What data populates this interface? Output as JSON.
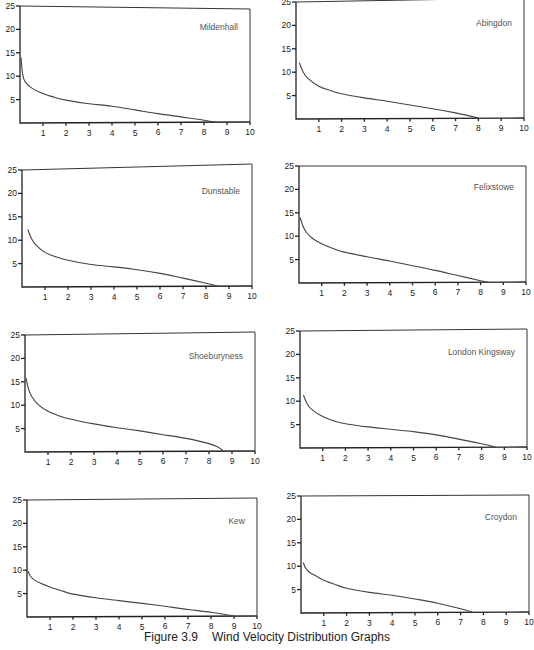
{
  "figure": {
    "number": "Figure 3.9",
    "title": "Wind Velocity Distribution Graphs"
  },
  "chart_data": [
    {
      "type": "line",
      "title": "Mildenhall",
      "xlabel": "",
      "ylabel": "",
      "xlim": [
        0,
        10
      ],
      "ylim": [
        0,
        25
      ],
      "x_ticks": [
        1,
        2,
        3,
        4,
        5,
        6,
        7,
        8,
        9,
        10
      ],
      "y_ticks": [
        5,
        10,
        15,
        20,
        25
      ],
      "grid": false,
      "x": [
        0.05,
        0.1,
        0.2,
        0.5,
        1,
        1.5,
        2,
        3,
        4,
        5,
        6,
        7,
        8,
        8.5
      ],
      "y": [
        14,
        11,
        9,
        7.5,
        6.3,
        5.5,
        4.9,
        4.1,
        3.6,
        2.8,
        2.0,
        1.3,
        0.6,
        0.2
      ]
    },
    {
      "type": "line",
      "title": "Abingdon",
      "xlabel": "",
      "ylabel": "",
      "xlim": [
        0,
        10
      ],
      "ylim": [
        0,
        25
      ],
      "x_ticks": [
        1,
        2,
        3,
        4,
        5,
        6,
        7,
        8,
        9,
        10
      ],
      "y_ticks": [
        5,
        10,
        15,
        20,
        25
      ],
      "grid": false,
      "x": [
        0.15,
        0.3,
        0.5,
        1,
        1.5,
        2,
        3,
        4,
        5,
        6,
        7,
        8
      ],
      "y": [
        12,
        10.2,
        8.8,
        7.0,
        6.1,
        5.4,
        4.5,
        3.8,
        3.0,
        2.2,
        1.3,
        0.2
      ]
    },
    {
      "type": "line",
      "title": "Dunstable",
      "xlabel": "",
      "ylabel": "",
      "xlim": [
        0,
        10
      ],
      "ylim": [
        0,
        25
      ],
      "x_ticks": [
        1,
        2,
        3,
        4,
        5,
        6,
        7,
        8,
        9,
        10
      ],
      "y_ticks": [
        5,
        10,
        15,
        20,
        25
      ],
      "grid": false,
      "x": [
        0.25,
        0.4,
        0.6,
        1,
        1.5,
        2,
        3,
        4,
        5,
        6,
        7,
        8,
        8.5
      ],
      "y": [
        12.3,
        10.5,
        9.0,
        7.4,
        6.4,
        5.7,
        4.8,
        4.3,
        3.7,
        2.9,
        1.9,
        0.8,
        0.2
      ]
    },
    {
      "type": "line",
      "title": "Felixstowe",
      "xlabel": "",
      "ylabel": "",
      "xlim": [
        0,
        10
      ],
      "ylim": [
        0,
        25
      ],
      "x_ticks": [
        1,
        2,
        3,
        4,
        5,
        6,
        7,
        8,
        9,
        10
      ],
      "y_ticks": [
        5,
        10,
        15,
        20,
        25
      ],
      "grid": false,
      "x": [
        0.05,
        0.15,
        0.3,
        0.6,
        1,
        1.5,
        2,
        3,
        4,
        5,
        6,
        7,
        8,
        8.3
      ],
      "y": [
        14,
        12.5,
        11,
        9.5,
        8.4,
        7.4,
        6.6,
        5.6,
        4.7,
        3.7,
        2.7,
        1.6,
        0.5,
        0.2
      ]
    },
    {
      "type": "line",
      "title": "Shoeburyness",
      "xlabel": "",
      "ylabel": "",
      "xlim": [
        0,
        10
      ],
      "ylim": [
        0,
        25
      ],
      "x_ticks": [
        1,
        2,
        3,
        4,
        5,
        6,
        7,
        8,
        9,
        10
      ],
      "y_ticks": [
        5,
        10,
        15,
        20,
        25
      ],
      "grid": false,
      "x": [
        0.05,
        0.15,
        0.3,
        0.6,
        1,
        1.5,
        2,
        3,
        4,
        5,
        6,
        7,
        8,
        8.4,
        8.6
      ],
      "y": [
        15.8,
        13.5,
        11.8,
        10.0,
        8.7,
        7.7,
        7.0,
        6.0,
        5.2,
        4.5,
        3.7,
        2.9,
        1.8,
        1.0,
        0.3
      ]
    },
    {
      "type": "line",
      "title": "London Kingsway",
      "xlabel": "",
      "ylabel": "",
      "xlim": [
        0,
        10
      ],
      "ylim": [
        0,
        25
      ],
      "x_ticks": [
        1,
        2,
        3,
        4,
        5,
        6,
        7,
        8,
        9,
        10
      ],
      "y_ticks": [
        5,
        10,
        15,
        20,
        25
      ],
      "grid": false,
      "x": [
        0.15,
        0.3,
        0.5,
        1,
        1.5,
        2,
        3,
        4,
        5,
        6,
        7,
        8,
        8.6
      ],
      "y": [
        11.3,
        9.6,
        8.3,
        6.7,
        5.8,
        5.2,
        4.5,
        4.0,
        3.5,
        2.8,
        1.9,
        0.9,
        0.2
      ]
    },
    {
      "type": "line",
      "title": "Kew",
      "xlabel": "",
      "ylabel": "",
      "xlim": [
        0,
        10
      ],
      "ylim": [
        0,
        25
      ],
      "x_ticks": [
        1,
        2,
        3,
        4,
        5,
        6,
        7,
        8,
        9,
        10
      ],
      "y_ticks": [
        5,
        10,
        15,
        20,
        25
      ],
      "grid": false,
      "x": [
        0.05,
        0.15,
        0.3,
        0.6,
        1,
        1.5,
        2,
        3,
        4,
        5,
        6,
        7,
        8,
        9
      ],
      "y": [
        9.8,
        8.7,
        8.0,
        7.2,
        6.4,
        5.6,
        4.9,
        4.1,
        3.5,
        2.9,
        2.3,
        1.6,
        1.0,
        0.2
      ]
    },
    {
      "type": "line",
      "title": "Croydon",
      "xlabel": "",
      "ylabel": "",
      "xlim": [
        0,
        10
      ],
      "ylim": [
        0,
        25
      ],
      "x_ticks": [
        1,
        2,
        3,
        4,
        5,
        6,
        7,
        8,
        9,
        10
      ],
      "y_ticks": [
        5,
        10,
        15,
        20,
        25
      ],
      "grid": false,
      "x": [
        0.1,
        0.2,
        0.4,
        0.7,
        1,
        1.5,
        2,
        3,
        4,
        5,
        6,
        7,
        7.5
      ],
      "y": [
        10.8,
        9.6,
        8.6,
        7.8,
        7.0,
        6.1,
        5.3,
        4.4,
        3.8,
        3.0,
        2.1,
        0.9,
        0.2
      ]
    }
  ],
  "layout": [
    {
      "ox": 20,
      "oy": 123,
      "w": 230,
      "h": 117,
      "rightTop": 3
    },
    {
      "ox": 296,
      "oy": 119,
      "w": 228,
      "h": 117,
      "rightTop": -4
    },
    {
      "ox": 22,
      "oy": 287,
      "w": 230,
      "h": 117,
      "rightTop": -6
    },
    {
      "ox": 299,
      "oy": 283,
      "w": 227,
      "h": 117,
      "rightTop": 0
    },
    {
      "ox": 25,
      "oy": 452,
      "w": 230,
      "h": 117,
      "rightTop": -3
    },
    {
      "ox": 300,
      "oy": 448,
      "w": 227,
      "h": 117,
      "rightTop": -2
    },
    {
      "ox": 27,
      "oy": 617,
      "w": 230,
      "h": 117,
      "rightTop": -2
    },
    {
      "ox": 301,
      "oy": 613,
      "w": 228,
      "h": 117,
      "rightTop": -1
    }
  ]
}
